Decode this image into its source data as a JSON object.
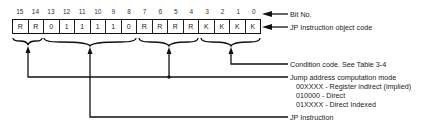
{
  "diagram": {
    "bit_numbers": [
      "15",
      "14",
      "13",
      "12",
      "11",
      "10",
      "9",
      "8",
      "7",
      "6",
      "5",
      "4",
      "3",
      "2",
      "1",
      "0"
    ],
    "bits": [
      "R",
      "R",
      "0",
      "1",
      "1",
      "1",
      "1",
      "0",
      "R",
      "R",
      "R",
      "R",
      "K",
      "K",
      "K",
      "K"
    ],
    "labels": {
      "bit_no": "Bit No.",
      "object_code": "JP Instruction object code",
      "condition_code": "Condition code. See Table 3-4",
      "jump_mode": "Jump address computation mode",
      "mode_1": "00XXXX - Register indirect (implied)",
      "mode_2": "010000 - Direct",
      "mode_3": "01XXXX - Direct Indexed",
      "jp_instruction": "JP Instruction"
    },
    "fields": [
      {
        "bits": "15-14",
        "meaning": "Jump address computation mode"
      },
      {
        "bits": "13-8",
        "meaning": "JP Instruction"
      },
      {
        "bits": "7-4",
        "meaning": "Jump address computation mode"
      },
      {
        "bits": "3-0",
        "meaning": "Condition code. See Table 3-4"
      }
    ]
  }
}
